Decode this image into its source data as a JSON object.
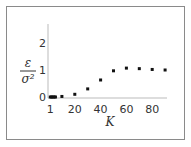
{
  "chart_data": {
    "type": "scatter",
    "title": "",
    "xlabel": "K",
    "ylabel_numerator": "ε",
    "ylabel_denominator": "σ²",
    "xlim": [
      0,
      95
    ],
    "ylim": [
      0,
      2.5
    ],
    "x_ticks": [
      "1",
      "20",
      "40",
      "60",
      "80"
    ],
    "y_ticks": [
      "0",
      "1",
      "2"
    ],
    "grid": false,
    "legend": null,
    "series": [
      {
        "name": "data",
        "x": [
          1,
          2,
          3,
          4,
          5,
          10,
          20,
          30,
          40,
          50,
          60,
          70,
          80,
          90
        ],
        "y": [
          0.0,
          0.0,
          0.0,
          0.0,
          0.0,
          0.02,
          0.1,
          0.3,
          0.63,
          0.97,
          1.07,
          1.05,
          1.02,
          1.0
        ]
      }
    ]
  }
}
